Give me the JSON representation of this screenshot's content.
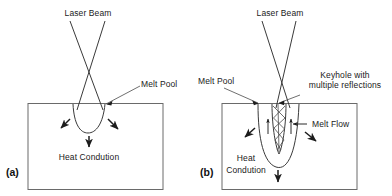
{
  "figure": {
    "background_color": "#ffffff",
    "line_color": "#3a3a3a",
    "text_color": "#1a1a1a"
  },
  "panels": [
    {
      "tag": "(a)",
      "name": "conduction-mode",
      "labels": {
        "laser_beam": "Laser Beam",
        "melt_pool": "Melt Pool",
        "heat_conduction": "Heat Condution"
      }
    },
    {
      "tag": "(b)",
      "name": "keyhole-mode",
      "labels": {
        "laser_beam": "Laser Beam",
        "melt_pool": "Melt Pool",
        "keyhole_line1": "Keyhole with",
        "keyhole_line2": "multiple reflections",
        "melt_flow": "Melt Flow",
        "heat_conduction_line1": "Heat",
        "heat_conduction_line2": "Condution"
      }
    }
  ]
}
